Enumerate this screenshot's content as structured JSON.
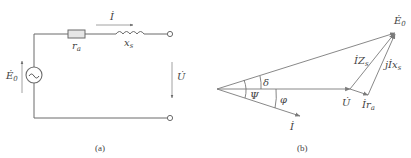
{
  "circuit": {
    "caption": "(a)",
    "source_label": "Ė",
    "source_sub": "0",
    "source_symbol": "~",
    "current_label": "İ",
    "voltage_label": "U̇",
    "resistor_label": "r",
    "resistor_sub": "a",
    "inductor_label": "x",
    "inductor_sub": "s"
  },
  "phasor": {
    "caption": "(b)",
    "e0_label": "Ė",
    "e0_sub": "0",
    "u_label": "U̇",
    "i_label": "İ",
    "ira_label": "İr",
    "ira_sub": "a",
    "izs_label": "İZ",
    "izs_sub": "s",
    "jixs_label": "jİx",
    "jixs_sub": "s",
    "angle_delta": "δ",
    "angle_psi": "Ψ",
    "angle_phi": "φ"
  },
  "colors": {
    "line": "#7a7a7a",
    "text": "#444444",
    "resistor_fill": "#e6e6e6"
  }
}
